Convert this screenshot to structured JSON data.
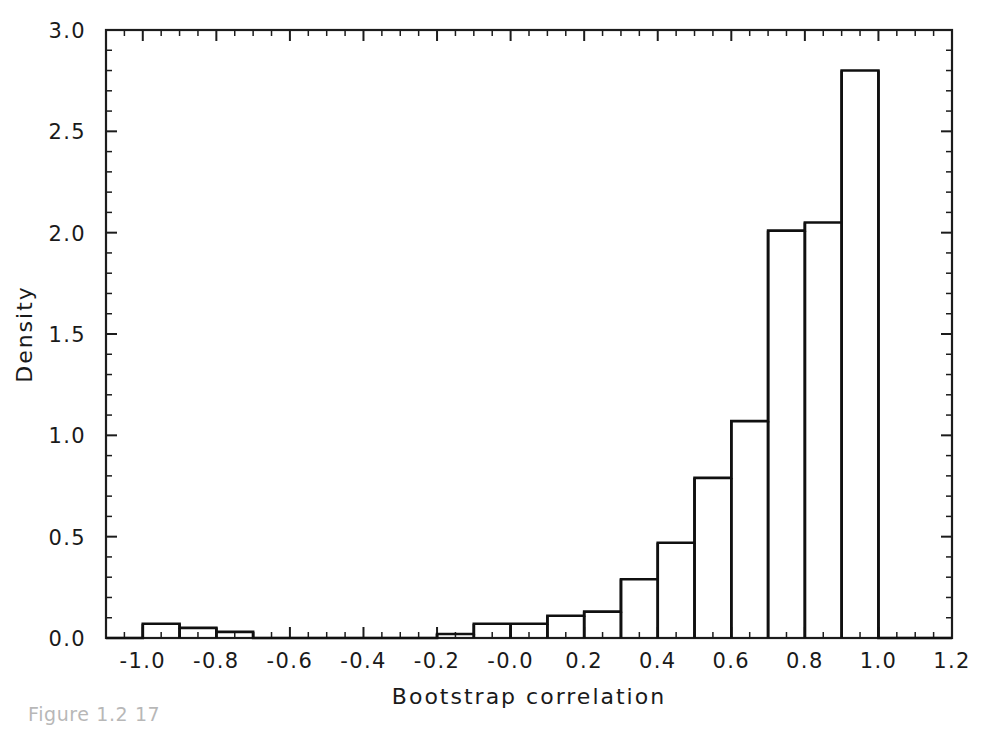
{
  "chart_data": {
    "type": "bar",
    "title": "",
    "subtitle": "",
    "xlabel": "Bootstrap correlation",
    "ylabel": "Density",
    "xlim": [
      -1.1,
      1.2
    ],
    "ylim": [
      0.0,
      3.0
    ],
    "grid": false,
    "legend": null,
    "bin_width": 0.1,
    "bin_edges": [
      -1.0,
      -0.9,
      -0.8,
      -0.7,
      -0.6,
      -0.5,
      -0.4,
      -0.3,
      -0.2,
      -0.1,
      0.0,
      0.1,
      0.2,
      0.3,
      0.4,
      0.5,
      0.6,
      0.7,
      0.8,
      0.9,
      1.0
    ],
    "categories": [
      "-1.0..-0.9",
      "-0.9..-0.8",
      "-0.8..-0.7",
      "-0.7..-0.6",
      "-0.6..-0.5",
      "-0.5..-0.4",
      "-0.4..-0.3",
      "-0.3..-0.2",
      "-0.2..-0.1",
      "-0.1..0.0",
      "0.0..0.1",
      "0.1..0.2",
      "0.2..0.3",
      "0.3..0.4",
      "0.4..0.5",
      "0.5..0.6",
      "0.6..0.7",
      "0.7..0.8",
      "0.8..0.9",
      "0.9..1.0"
    ],
    "values": [
      0.07,
      0.05,
      0.03,
      0.0,
      0.0,
      0.0,
      0.0,
      0.0,
      0.02,
      0.07,
      0.07,
      0.11,
      0.13,
      0.29,
      0.47,
      0.79,
      1.07,
      2.01,
      2.05,
      2.8
    ],
    "xticks": [
      -1.0,
      -0.8,
      -0.6,
      -0.4,
      -0.2,
      -0.0,
      0.2,
      0.4,
      0.6,
      0.8,
      1.0,
      1.2
    ],
    "xticklabels": [
      "-1.0",
      "-0.8",
      "-0.6",
      "-0.4",
      "-0.2",
      "-0.0",
      "0.2",
      "0.4",
      "0.6",
      "0.8",
      "1.0",
      "1.2"
    ],
    "yticks": [
      0.0,
      0.5,
      1.0,
      1.5,
      2.0,
      2.5,
      3.0
    ],
    "yticklabels": [
      "0.0",
      "0.5",
      "1.0",
      "1.5",
      "2.0",
      "2.5",
      "3.0"
    ],
    "x_minor_interval": 0.05,
    "y_minor_interval": 0.1,
    "bar_fill_color": "#ffffff",
    "bar_edge_color": "#101010",
    "axis_color": "#1c1c1c",
    "background_color": "#ffffff"
  },
  "caption": {
    "partial_text": "Figure 1.2 17"
  }
}
